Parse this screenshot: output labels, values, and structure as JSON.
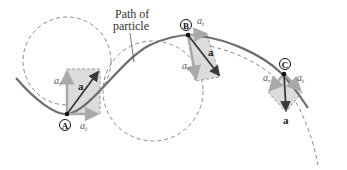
{
  "diagram": {
    "caption": {
      "line1": "Path of",
      "line2": "particle"
    },
    "points": [
      {
        "id": "A",
        "label": "A",
        "at_label": "a",
        "at_sub": "t",
        "ar_label": "a",
        "ar_sub": "r",
        "a_label": "a"
      },
      {
        "id": "B",
        "label": "B",
        "at_label": "a",
        "at_sub": "t",
        "ar_label": "a",
        "ar_sub": "r",
        "a_label": "a"
      },
      {
        "id": "C",
        "label": "C",
        "at_label": "a",
        "at_sub": "t",
        "ar_label": "a",
        "ar_sub": "r",
        "a_label": "a"
      }
    ],
    "colors": {
      "path": "#6e6e6e",
      "dashed": "#8a8a8a",
      "component_arrow": "#a9a9a9",
      "rect_fill": "#dcdcdc",
      "total_arrow": "#3a3a3a"
    }
  }
}
